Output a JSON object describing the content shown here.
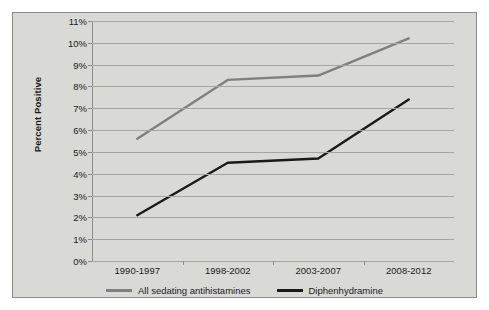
{
  "chart_data": {
    "type": "line",
    "title": "",
    "xlabel": "",
    "ylabel": "Percent Positive",
    "categories": [
      "1990-1997",
      "1998-2002",
      "2003-2007",
      "2008-2012"
    ],
    "ylim": [
      0,
      11
    ],
    "ytick_labels": [
      "0%",
      "1%",
      "2%",
      "3%",
      "4%",
      "5%",
      "6%",
      "7%",
      "8%",
      "9%",
      "10%",
      "11%"
    ],
    "ytick_values": [
      0,
      1,
      2,
      3,
      4,
      5,
      6,
      7,
      8,
      9,
      10,
      11
    ],
    "grid": true,
    "legend_position": "bottom",
    "series": [
      {
        "name": "All sedating antihistamines",
        "color": "#808080",
        "values": [
          5.6,
          8.3,
          8.5,
          10.2
        ]
      },
      {
        "name": "Diphenhydramine",
        "color": "#1a1a1a",
        "values": [
          2.1,
          4.5,
          4.7,
          7.4
        ]
      }
    ]
  },
  "colors": {
    "figure_background": "#d9d9d6",
    "figure_border": "#8c8c8c",
    "gridline": "#a6a6a1",
    "axis": "#8f8f8a",
    "text": "#1a1a1a"
  }
}
